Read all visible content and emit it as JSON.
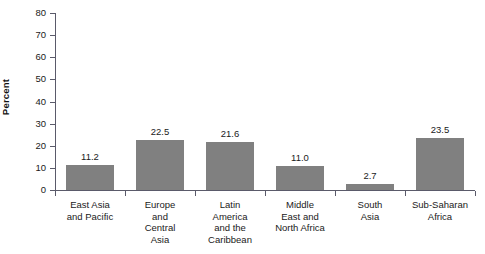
{
  "chart_data": {
    "type": "bar",
    "title": "",
    "xlabel": "",
    "ylabel": "Percent",
    "ylim": [
      0,
      80
    ],
    "yticks": [
      0,
      10,
      20,
      30,
      40,
      50,
      60,
      70,
      80
    ],
    "grid": false,
    "legend": false,
    "categories": [
      "East Asia and Pacific",
      "Europe and Central Asia",
      "Latin America and the Caribbean",
      "Middle East and North Africa",
      "South Asia",
      "Sub-Saharan Africa"
    ],
    "category_label_lines": [
      [
        "East Asia",
        "and Pacific"
      ],
      [
        "Europe",
        "and",
        "Central",
        "Asia"
      ],
      [
        "Latin",
        "America",
        "and the",
        "Caribbean"
      ],
      [
        "Middle",
        "East and",
        "North Africa"
      ],
      [
        "South",
        "Asia"
      ],
      [
        "Sub-Saharan",
        "Africa"
      ]
    ],
    "values": [
      11.2,
      22.5,
      21.6,
      11.0,
      2.7,
      23.5
    ],
    "value_labels": [
      "11.2",
      "22.5",
      "21.6",
      "11.0",
      "2.7",
      "23.5"
    ],
    "bar_color": "#808080",
    "axis_color": "#5a5a6a",
    "background": "#ffffff"
  },
  "axis": {
    "y_tick_labels": [
      "0",
      "10",
      "20",
      "30",
      "40",
      "50",
      "60",
      "70",
      "80"
    ],
    "y_title": "Percent"
  }
}
